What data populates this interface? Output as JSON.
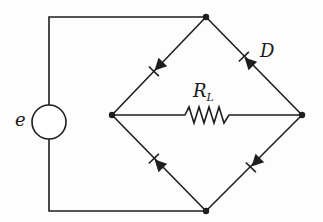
{
  "diagram": {
    "type": "bridge-rectifier-circuit",
    "labels": {
      "source": "e",
      "diode": "D",
      "load_main": "R",
      "load_sub": "L"
    },
    "nodes": {
      "top": [
        206,
        17
      ],
      "left": [
        112,
        115
      ],
      "right": [
        302,
        115
      ],
      "bottom": [
        206,
        211
      ]
    },
    "components": [
      {
        "id": "source",
        "kind": "voltage-source",
        "label": "e"
      },
      {
        "id": "load",
        "kind": "resistor",
        "label": "R_L",
        "between": [
          "left",
          "right"
        ]
      },
      {
        "id": "d1",
        "kind": "diode",
        "between": [
          "top",
          "left"
        ],
        "anode": "top",
        "cathode": "left"
      },
      {
        "id": "d2",
        "kind": "diode",
        "label": "D",
        "between": [
          "right",
          "top"
        ],
        "anode": "right",
        "cathode": "top"
      },
      {
        "id": "d3",
        "kind": "diode",
        "between": [
          "bottom",
          "left"
        ],
        "anode": "bottom",
        "cathode": "left"
      },
      {
        "id": "d4",
        "kind": "diode",
        "between": [
          "right",
          "bottom"
        ],
        "anode": "right",
        "cathode": "bottom"
      }
    ],
    "colors": {
      "line": "#1e1e1e",
      "background": "#fdfdfd"
    }
  }
}
